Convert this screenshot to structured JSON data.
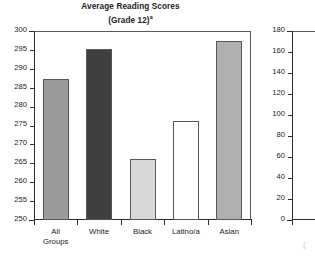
{
  "chart_data": {
    "type": "bar",
    "title": "Average Reading Scores",
    "subtitle": "(Grade 12)",
    "title_footnote_marker": "a",
    "xlabel": "",
    "ylabel": "",
    "ylim": [
      250,
      300
    ],
    "ytick_step": 5,
    "grid": false,
    "legend": "none",
    "categories": [
      "All Groups",
      "White",
      "Black",
      "Latino/a",
      "Asian"
    ],
    "category_lines": [
      [
        "All",
        "Groups"
      ],
      [
        "White"
      ],
      [
        "Black"
      ],
      [
        "Latino/a"
      ],
      [
        "Asian"
      ]
    ],
    "values": [
      287.3,
      295.3,
      266.2,
      276.3,
      297.3
    ],
    "yticks": [
      300,
      295,
      290,
      285,
      280,
      275,
      270,
      265,
      260,
      255,
      250
    ],
    "bar_colors": [
      "#9a9a9a",
      "#3f3f3f",
      "#d8d8d8",
      "#ffffff",
      "#b0b0b0"
    ],
    "bar_edge_color": "#55585a"
  },
  "secondary_chart": {
    "type": "bar",
    "clipped": true,
    "note": "second chart cut off at right edge of image; only y-axis visible",
    "ylim": [
      0,
      180
    ],
    "ytick_step": 20,
    "yticks": [
      180,
      160,
      140,
      120,
      100,
      80,
      60,
      40,
      20,
      0
    ],
    "stub_label": "("
  }
}
